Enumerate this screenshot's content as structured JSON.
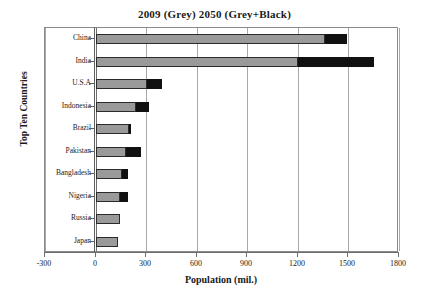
{
  "chart_data": {
    "type": "bar",
    "orientation": "horizontal",
    "stacked": true,
    "title": "2009 (Grey)  2050 (Grey+Black)",
    "xlabel": "Population (mil.)",
    "ylabel": "Top Ten Countries",
    "grid": true,
    "legend_position": "none",
    "xlim": [
      -300,
      1800
    ],
    "xticks": [
      -300,
      0,
      300,
      600,
      900,
      1200,
      1500,
      1800
    ],
    "xtick_labels": [
      "-300",
      "0",
      "300",
      "600",
      "900",
      "1200",
      "1500",
      "1800"
    ],
    "categories": [
      "China",
      "India",
      "U.S.A",
      "Indonesia",
      "Brazil",
      "Pakistan",
      "Bangladesh",
      "Nigeria",
      "Russia",
      "Japan"
    ],
    "series": [
      {
        "name": "2009 (Grey)",
        "color": "#9a9a9a",
        "values": [
          1360,
          1200,
          305,
          240,
          195,
          180,
          155,
          145,
          140,
          128
        ]
      },
      {
        "name": "2050 increase (Black)",
        "color": "#111111",
        "values": [
          130,
          450,
          85,
          75,
          10,
          90,
          35,
          45,
          0,
          0
        ]
      }
    ],
    "totals_2050": [
      1490,
      1650,
      390,
      315,
      205,
      270,
      190,
      190,
      140,
      128
    ]
  },
  "axis": {
    "y_title": "Top Ten Countries",
    "x_title": "Population (mil.)"
  }
}
